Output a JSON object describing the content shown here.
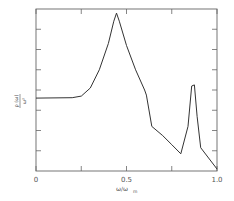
{
  "chart_data": {
    "type": "line",
    "title": "",
    "xlabel": "ω/ω_m",
    "ylabel": "ρ(ω)/ω²",
    "xlim": [
      0,
      1.0
    ],
    "ylim": [
      0,
      8
    ],
    "x_ticks": [
      0,
      0.25,
      0.5,
      0.75,
      1.0
    ],
    "x_tick_labels": [
      "0",
      "",
      "0.5",
      "",
      "1.0"
    ],
    "y_ticks": [
      1,
      2,
      3,
      4,
      5,
      6,
      7
    ],
    "y_tick_labels": [
      "",
      "",
      "",
      "",
      "",
      "",
      ""
    ],
    "grid": false,
    "legend": null,
    "series": [
      {
        "name": "ρ(ω)/ω²",
        "x": [
          0.0,
          0.2,
          0.25,
          0.3,
          0.35,
          0.4,
          0.43,
          0.445,
          0.46,
          0.5,
          0.55,
          0.6,
          0.61,
          0.64,
          0.7,
          0.75,
          0.8,
          0.84,
          0.86,
          0.875,
          0.89,
          0.91,
          1.0
        ],
        "y": [
          3.6,
          3.62,
          3.7,
          4.1,
          5.0,
          6.3,
          7.4,
          7.8,
          7.4,
          6.2,
          5.0,
          4.0,
          3.75,
          2.2,
          1.75,
          1.3,
          0.85,
          2.2,
          4.2,
          4.25,
          2.7,
          1.15,
          0.1
        ]
      }
    ]
  },
  "labels": {
    "x_axis": "ω/ω",
    "x_axis_sub": "m",
    "y_axis_num": "ρ (ω)",
    "y_axis_den": "ω²",
    "x0": "0",
    "x05": "0.5",
    "x10": "1.0"
  }
}
